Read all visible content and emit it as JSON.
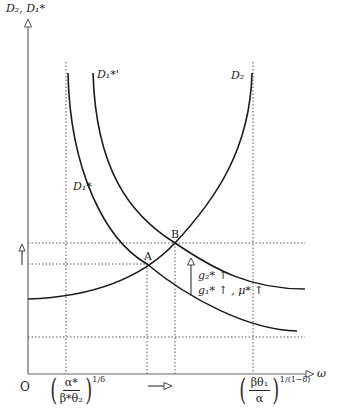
{
  "figure": {
    "y_axis_label": "D₂, D₁*",
    "x_axis_label": "ω",
    "origin_label": "O",
    "curves": [
      {
        "id": "D2",
        "label": "D₂"
      },
      {
        "id": "D1star",
        "label": "D₁*"
      },
      {
        "id": "D1star_prime",
        "label": "D₁*'"
      }
    ],
    "points": [
      {
        "id": "A",
        "label": "A"
      },
      {
        "id": "B",
        "label": "B"
      }
    ],
    "annotation": {
      "line1": "g₂* ↑",
      "line2": "g₁* ↑ , μ* ↑"
    },
    "x_ticks": {
      "left": {
        "numerator": "α*",
        "denominator": "β*θ₂",
        "exponent": "1/δ"
      },
      "right": {
        "numerator": "βθ₁",
        "denominator": "α",
        "exponent": "1/(1−δ)"
      }
    },
    "colors": {
      "curve": "#1a1a1a",
      "axis": "#555555",
      "guide": "#444444"
    }
  }
}
